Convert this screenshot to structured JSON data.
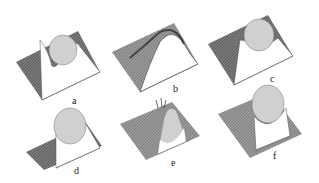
{
  "figure": {
    "panels": [
      {
        "id": "a",
        "label": "a"
      },
      {
        "id": "b",
        "label": "b"
      },
      {
        "id": "c",
        "label": "c"
      },
      {
        "id": "d",
        "label": "d"
      },
      {
        "id": "e",
        "label": "e"
      },
      {
        "id": "f",
        "label": "f"
      }
    ],
    "colors": {
      "surface_dark": "#555555",
      "surface_mid": "#8a8a8a",
      "contour_light": "#dddddd",
      "background": "#ffffff"
    }
  }
}
